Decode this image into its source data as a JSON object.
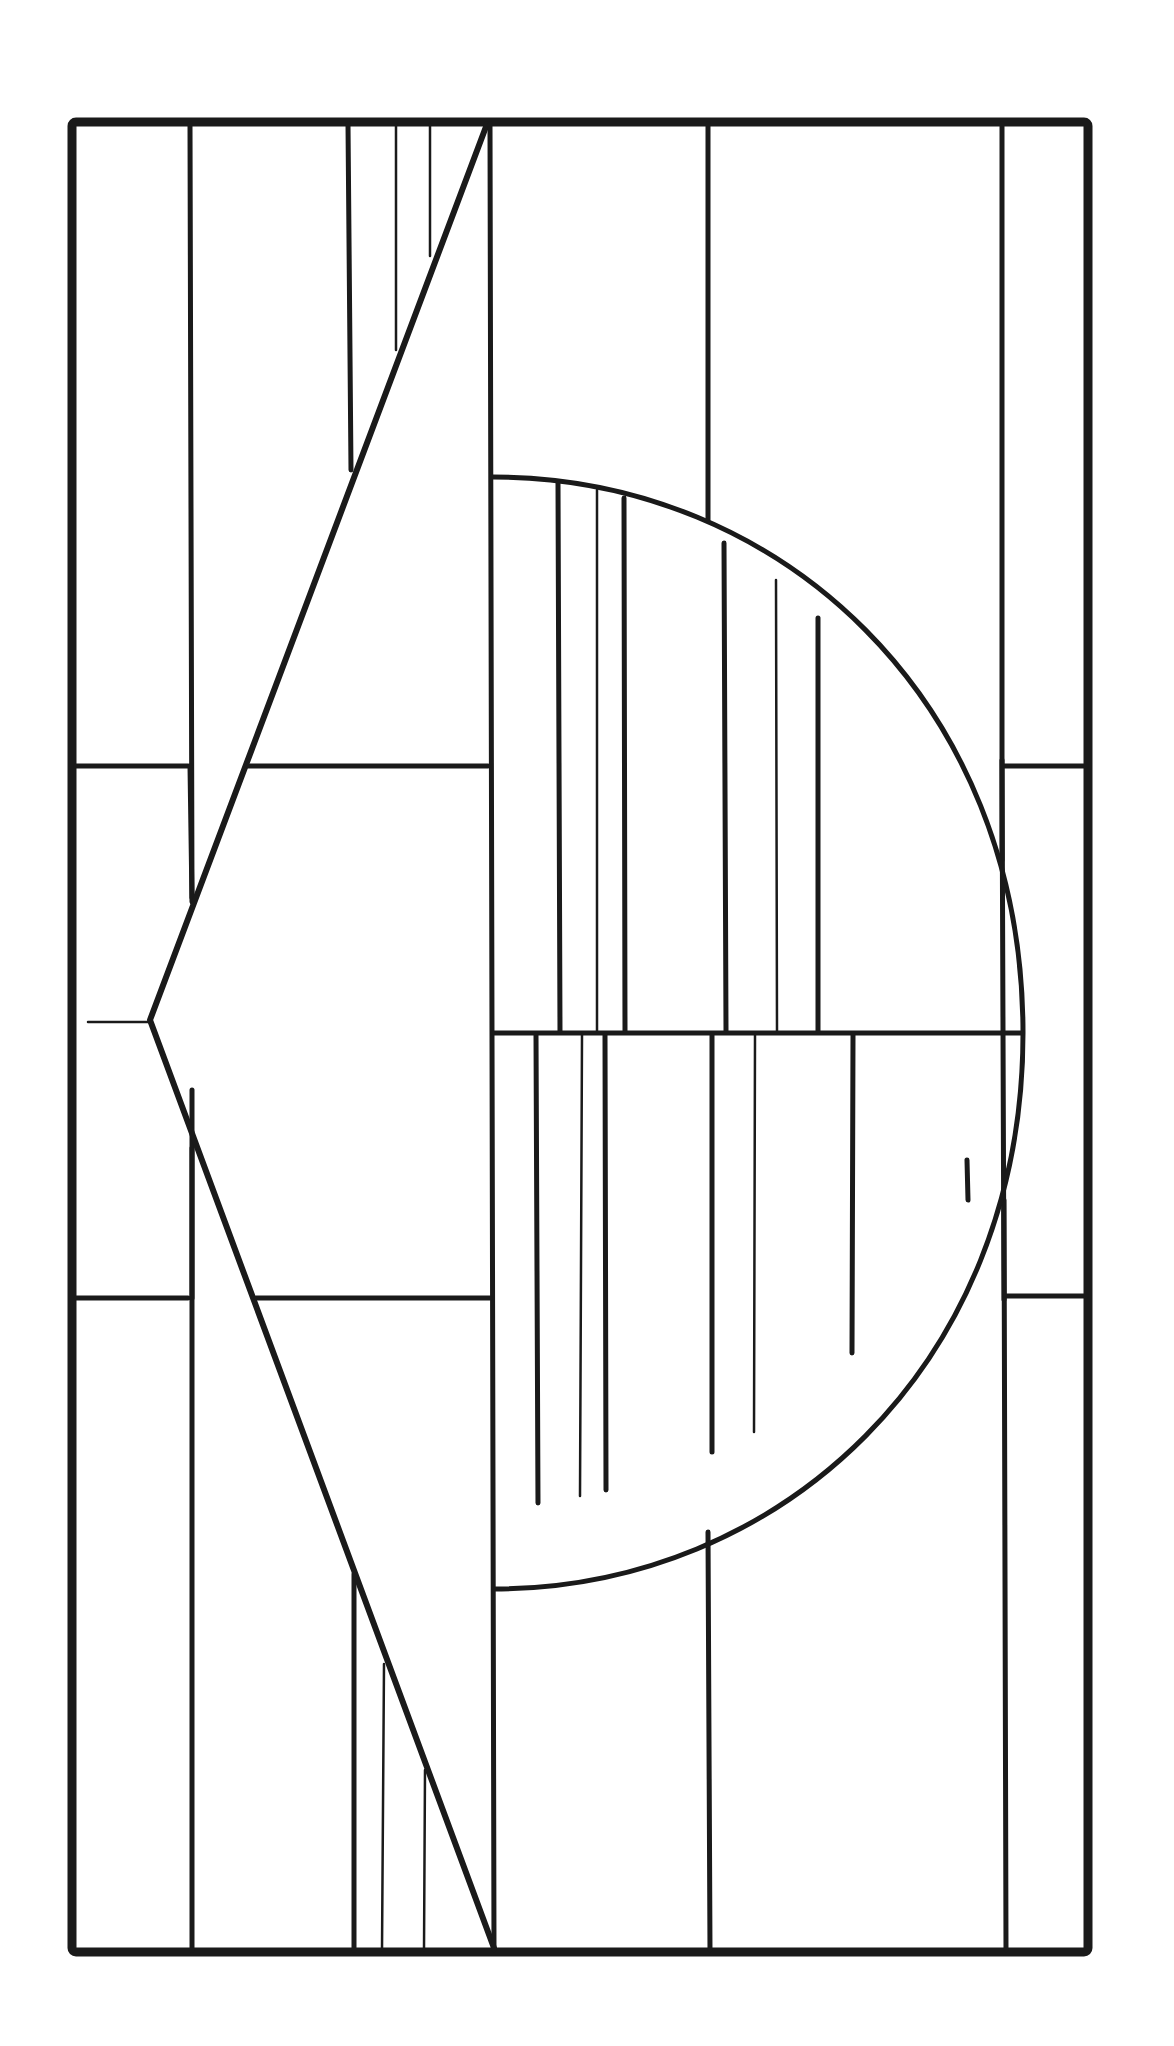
{
  "figure": {
    "colors": {
      "line": "#1a1a1a",
      "background": "#ffffff"
    },
    "frame": {
      "x1": 70,
      "y1": 120,
      "x2": 1090,
      "y2": 1952
    },
    "components": [
      {
        "name": "outer-frame",
        "shape": "rectangle"
      },
      {
        "name": "chevron",
        "shape": "left-pointing arrow",
        "tip": [
          150,
          1020
        ],
        "top_end": [
          487,
          124
        ],
        "bottom_end": [
          494,
          1948
        ]
      },
      {
        "name": "semicircle",
        "shape": "half-disc",
        "center": [
          493,
          1033
        ],
        "radius_x": 530,
        "radius_y": 556
      },
      {
        "name": "left-columns",
        "count": 2
      },
      {
        "name": "right-column",
        "count": 1
      },
      {
        "name": "center-horizontal-bar",
        "y": 1033
      }
    ]
  }
}
